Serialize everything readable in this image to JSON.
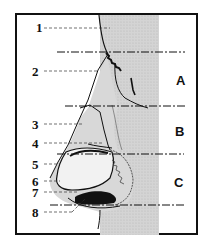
{
  "diagram": {
    "type": "anatomical-lateral-nose",
    "labels": [
      {
        "id": "1",
        "text": "1"
      },
      {
        "id": "2",
        "text": "2"
      },
      {
        "id": "3",
        "text": "3"
      },
      {
        "id": "4",
        "text": "4"
      },
      {
        "id": "5",
        "text": "5"
      },
      {
        "id": "6",
        "text": "6"
      },
      {
        "id": "7",
        "text": "7"
      },
      {
        "id": "8",
        "text": "8"
      }
    ],
    "zones": [
      {
        "id": "A",
        "text": "A"
      },
      {
        "id": "B",
        "text": "B"
      },
      {
        "id": "C",
        "text": "C"
      }
    ]
  }
}
